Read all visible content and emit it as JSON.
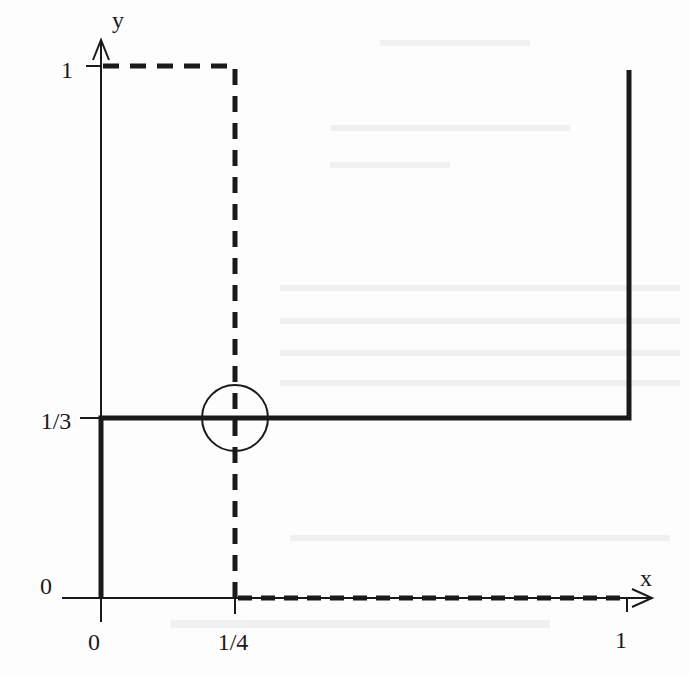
{
  "figure": {
    "axes": {
      "x_label": "x",
      "y_label": "y",
      "x_ticks": [
        {
          "label": "0",
          "value": 0
        },
        {
          "label": "1/4",
          "value": 0.25
        },
        {
          "label": "1",
          "value": 1
        }
      ],
      "y_ticks": [
        {
          "label": "0",
          "value": 0
        },
        {
          "label": "1/3",
          "value": 0.3333
        },
        {
          "label": "1",
          "value": 1
        }
      ]
    },
    "solid_curve": {
      "description": "Thick solid best-response path",
      "points": [
        [
          0,
          0
        ],
        [
          0,
          0.3333
        ],
        [
          1,
          0.3333
        ],
        [
          1,
          1
        ]
      ]
    },
    "dashed_curve": {
      "description": "Thick dashed best-response path",
      "points": [
        [
          0,
          1
        ],
        [
          0.25,
          1
        ],
        [
          0.25,
          0
        ],
        [
          1,
          0
        ]
      ]
    },
    "equilibrium_marker": {
      "description": "Circle at intersection",
      "x": 0.25,
      "y": 0.3333
    },
    "colors": {
      "ink": "#1a1a1a",
      "background": "#fdfdfd",
      "bleed_through": "#e6e6e6"
    }
  }
}
